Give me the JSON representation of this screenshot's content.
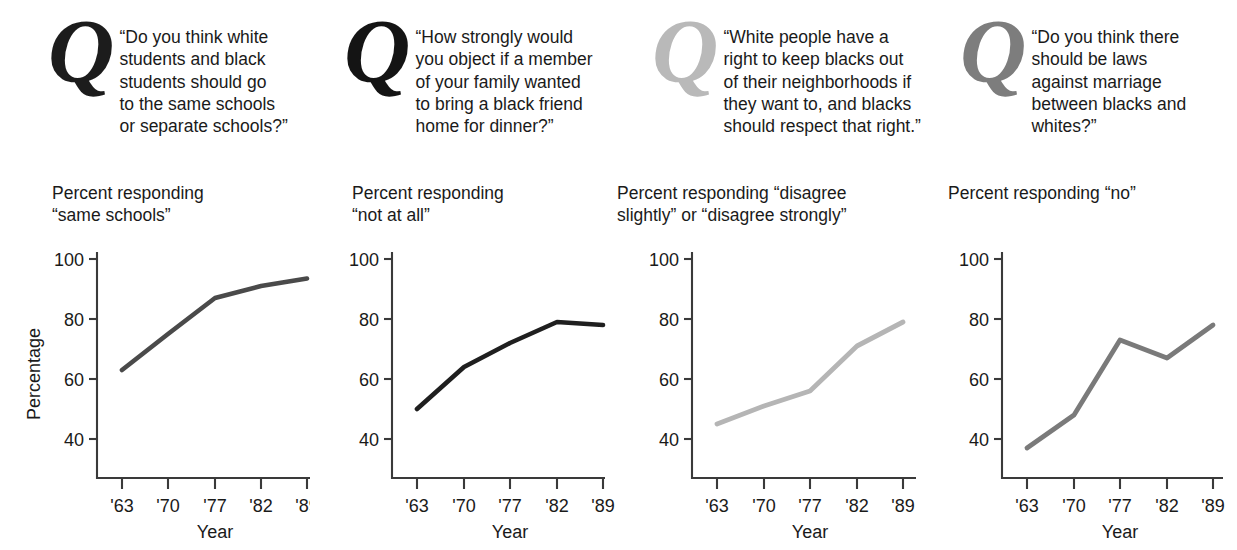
{
  "figure": {
    "shared_xlabel": "Year",
    "shared_ylabel": "Percentage",
    "marker": "Q",
    "xtick_labels": [
      "'63",
      "'70",
      "'77",
      "'82",
      "'89"
    ],
    "ytick_labels": [
      "100",
      "80",
      "60",
      "40"
    ]
  },
  "panels": [
    {
      "id": "panel-schools",
      "marker": "Q",
      "marker_color": "#1c1c1c",
      "question": "“Do you think white\nstudents and black\nstudents should go\nto the same schools\nor separate schools?”",
      "subtitle": "Percent responding\n “same schools”",
      "ylabel": "Percentage",
      "xlabel": "Year"
    },
    {
      "id": "panel-dinner",
      "marker": "Q",
      "marker_color": "#141414",
      "question": "“How strongly would\nyou object if a member\nof your family wanted\nto bring a black friend\nhome for dinner?”",
      "subtitle": "Percent responding\n “not at all”",
      "ylabel": "",
      "xlabel": "Year"
    },
    {
      "id": "panel-neighborhoods",
      "marker": "Q",
      "marker_color": "#b9b9b9",
      "question": "“White people have a\nright to keep blacks out\nof their neighborhoods if\nthey want to, and blacks\nshould respect that right.”",
      "subtitle": "Percent responding “disagree\nslightly” or “disagree strongly”",
      "ylabel": "",
      "xlabel": "Year"
    },
    {
      "id": "panel-marriage",
      "marker": "Q",
      "marker_color": "#7d7d7d",
      "question": "“Do you think there\nshould be laws\nagainst marriage\n between blacks and\nwhites?”",
      "subtitle": "Percent responding “no”",
      "ylabel": "",
      "xlabel": "Year"
    }
  ],
  "chart_data": [
    {
      "type": "line",
      "title": "Percent responding “same schools”",
      "xlabel": "Year",
      "ylabel": "Percentage",
      "categories": [
        "'63",
        "'70",
        "'77",
        "'82",
        "'89"
      ],
      "x": [
        1963,
        1970,
        1977,
        1982,
        1989
      ],
      "values": [
        63,
        75,
        87,
        91,
        93.5
      ],
      "ylim": [
        28,
        104
      ],
      "yticks": [
        40,
        60,
        80,
        100
      ],
      "grid": false,
      "legend": "none",
      "line_color": "#4a4a4a"
    },
    {
      "type": "line",
      "title": "Percent responding “not at all”",
      "xlabel": "Year",
      "ylabel": "",
      "categories": [
        "'63",
        "'70",
        "'77",
        "'82",
        "'89"
      ],
      "x": [
        1963,
        1970,
        1977,
        1982,
        1989
      ],
      "values": [
        50,
        64,
        72,
        79,
        78
      ],
      "ylim": [
        28,
        104
      ],
      "yticks": [
        40,
        60,
        80,
        100
      ],
      "grid": false,
      "legend": "none",
      "line_color": "#1f1f1f"
    },
    {
      "type": "line",
      "title": "Percent responding “disagree slightly” or “disagree strongly”",
      "xlabel": "Year",
      "ylabel": "",
      "categories": [
        "'63",
        "'70",
        "'77",
        "'82",
        "'89"
      ],
      "x": [
        1963,
        1970,
        1977,
        1982,
        1989
      ],
      "values": [
        45,
        51,
        56,
        71,
        79
      ],
      "ylim": [
        28,
        104
      ],
      "yticks": [
        40,
        60,
        80,
        100
      ],
      "grid": false,
      "legend": "none",
      "line_color": "#b5b5b5"
    },
    {
      "type": "line",
      "title": "Percent responding “no”",
      "xlabel": "Year",
      "ylabel": "",
      "categories": [
        "'63",
        "'70",
        "'77",
        "'82",
        "'89"
      ],
      "x": [
        1963,
        1970,
        1977,
        1982,
        1989
      ],
      "values": [
        37,
        48,
        73,
        67,
        78
      ],
      "ylim": [
        28,
        104
      ],
      "yticks": [
        40,
        60,
        80,
        100
      ],
      "grid": false,
      "legend": "none",
      "line_color": "#7a7a7a"
    }
  ]
}
